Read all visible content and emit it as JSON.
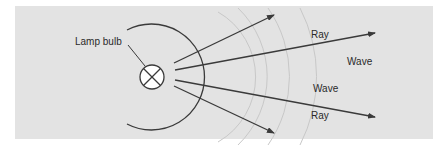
{
  "diagram": {
    "labels": {
      "lamp": "Lamp bulb",
      "ray_top": "Ray",
      "ray_bottom": "Ray",
      "wave_right": "Wave",
      "wave_mid": "Wave"
    },
    "colors": {
      "panel": "#e3e3e3",
      "line": "#3a3a3a",
      "wave": "#c9c9c9",
      "bulb_fill": "#ffffff"
    }
  }
}
